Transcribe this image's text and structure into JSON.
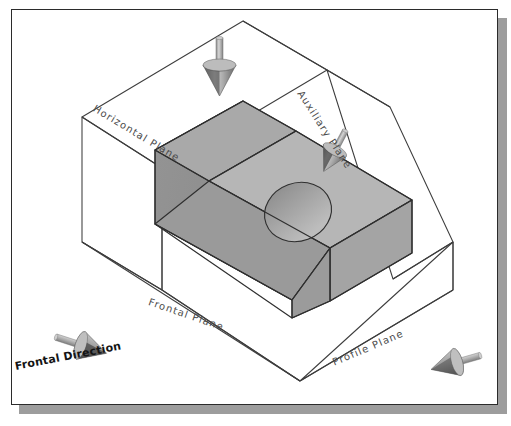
{
  "labels": {
    "horizontal_plane": "Horizontal Plane",
    "auxiliary_plane": "Auxiliary Plane",
    "frontal_plane": "Frontal Plane",
    "profile_plane": "Profile Plane",
    "frontal_direction": "Frontal Direction"
  },
  "arrows": [
    {
      "name": "horizontal-view-arrow",
      "direction": "down",
      "plane": "Horizontal Plane"
    },
    {
      "name": "auxiliary-view-arrow",
      "direction": "down-left",
      "plane": "Auxiliary Plane"
    },
    {
      "name": "frontal-view-arrow",
      "direction": "right-down",
      "plane": "Frontal Plane"
    },
    {
      "name": "profile-view-arrow",
      "direction": "left-down",
      "plane": "Profile Plane"
    }
  ],
  "colors": {
    "frame_border": "#2b2b2b",
    "frame_shadow": "#9d9d9d",
    "page_background": "#ffffff",
    "glass_box_line": "#3d3d3d",
    "solid_top_face": "#b4b4b4",
    "solid_incline_face": "#b9b9b9",
    "solid_left_face": "#8e8e8e",
    "solid_front_face": "#a2a2a2",
    "solid_edge": "#2f2f2f",
    "hole_interior": "#9a9a9a",
    "arrow_light": "#cfcfcf",
    "arrow_mid": "#a8a8a8",
    "arrow_dark": "#4a4a4a",
    "label_text": "#4a4a4a",
    "direction_text": "#141414"
  },
  "solid": {
    "name": "inclined-wedge-block",
    "features": [
      "inclined surface",
      "through hole",
      "rectangular base"
    ]
  }
}
